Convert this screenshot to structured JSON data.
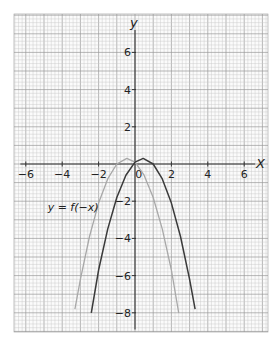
{
  "chart_data": {
    "type": "line",
    "title": "",
    "xlabel": "x",
    "ylabel": "y",
    "xlim": [
      -6.6,
      7.3
    ],
    "ylim": [
      -9.0,
      8.1
    ],
    "grid": true,
    "x_ticks": [
      -6,
      -4,
      -2,
      0,
      2,
      4,
      6
    ],
    "x_tick_labels": [
      "−6",
      "−4",
      "−2",
      "0",
      "2",
      "4",
      "6"
    ],
    "y_ticks": [
      -8,
      -6,
      -4,
      -2,
      2,
      4,
      6
    ],
    "y_tick_labels": [
      "−8",
      "−6",
      "−4",
      "−2",
      "2",
      "4",
      "6"
    ],
    "series": [
      {
        "name": "y = f(x)",
        "color": "#3a3a3a",
        "description": "downward parabola, vertex ≈ (0.45, 0.3)",
        "x": [
          -2.4,
          -2.0,
          -1.5,
          -1.0,
          -0.5,
          0.0,
          0.45,
          1.0,
          1.5,
          2.0,
          2.5,
          3.0,
          3.3
        ],
        "y": [
          -8.0,
          -5.7,
          -3.5,
          -1.8,
          -0.6,
          0.1,
          0.3,
          0.0,
          -0.8,
          -2.1,
          -3.9,
          -6.2,
          -7.8
        ]
      },
      {
        "name": "y = f(−x)",
        "color": "#a8a8a8",
        "description": "reflection in the y-axis, vertex ≈ (−0.45, 0.3)",
        "x": [
          -3.3,
          -3.0,
          -2.5,
          -2.0,
          -1.5,
          -1.0,
          -0.45,
          0.0,
          0.5,
          1.0,
          1.5,
          2.0,
          2.4
        ],
        "y": [
          -7.8,
          -6.2,
          -3.9,
          -2.1,
          -0.8,
          0.0,
          0.3,
          0.1,
          -0.6,
          -1.8,
          -3.5,
          -5.7,
          -8.0
        ]
      }
    ],
    "annotations": [
      {
        "text": "y = f(−x)",
        "x": -4.8,
        "y": -2.5
      }
    ]
  },
  "labels": {
    "x_axis": "X",
    "y_axis": "y",
    "curve_label": "y = f(−x)"
  },
  "colors": {
    "grid_minor": "#c9c9c9",
    "grid_major": "#9a9a9a",
    "axis": "#333333",
    "curve_f": "#3a3a3a",
    "curve_f_neg": "#a8a8a8"
  }
}
